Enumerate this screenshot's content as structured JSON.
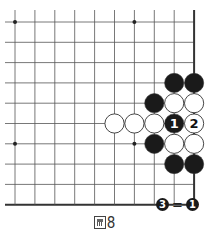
{
  "diagram": {
    "grid": {
      "x0": 15,
      "y0": 22,
      "dx": 19.9,
      "dy": 20.3,
      "cols": 10,
      "rows": 10,
      "line_color": "#555555",
      "edge_right": true,
      "edge_bottom": true
    },
    "star_points": [
      [
        0,
        0
      ],
      [
        6,
        0
      ],
      [
        0,
        6
      ],
      [
        6,
        6
      ]
    ],
    "stones": [
      {
        "col": 8,
        "row": 3,
        "color": "black",
        "label": ""
      },
      {
        "col": 9,
        "row": 3,
        "color": "black",
        "label": ""
      },
      {
        "col": 7,
        "row": 4,
        "color": "black",
        "label": ""
      },
      {
        "col": 8,
        "row": 4,
        "color": "white",
        "label": ""
      },
      {
        "col": 9,
        "row": 4,
        "color": "white",
        "label": ""
      },
      {
        "col": 5,
        "row": 5,
        "color": "white",
        "label": ""
      },
      {
        "col": 6,
        "row": 5,
        "color": "white",
        "label": ""
      },
      {
        "col": 7,
        "row": 5,
        "color": "white",
        "label": ""
      },
      {
        "col": 8,
        "row": 5,
        "color": "black",
        "label": "1"
      },
      {
        "col": 9,
        "row": 5,
        "color": "white",
        "label": "2"
      },
      {
        "col": 7,
        "row": 6,
        "color": "black",
        "label": ""
      },
      {
        "col": 8,
        "row": 6,
        "color": "white",
        "label": ""
      },
      {
        "col": 9,
        "row": 6,
        "color": "white",
        "label": ""
      },
      {
        "col": 8,
        "row": 7,
        "color": "black",
        "label": ""
      },
      {
        "col": 9,
        "row": 7,
        "color": "black",
        "label": ""
      }
    ],
    "colors": {
      "black_stone": "#1a1a1a",
      "white_stone": "#ffffff",
      "stone_outline": "#333333"
    }
  },
  "note": {
    "left": "3",
    "equals": "=",
    "right": "1"
  },
  "caption": {
    "icon": "figure-icon",
    "number": "8"
  }
}
